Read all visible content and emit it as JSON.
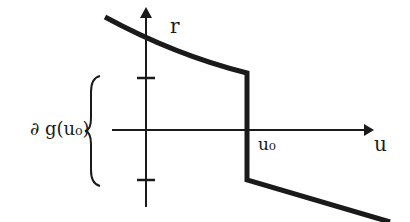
{
  "diagram": {
    "title": "",
    "axes": {
      "vertical_label": "r",
      "horizontal_label": "u"
    },
    "labels": {
      "point": "u₀",
      "subdifferential": "∂ g(u₀)"
    },
    "colors": {
      "ink": "#1a1a1a",
      "background": "#ffffff"
    },
    "graph": {
      "description": "Monotone decreasing graph with a vertical jump at u0 spanning the subdifferential interval",
      "points": [
        [
          105,
          17
        ],
        [
          146,
          40
        ],
        [
          200,
          60
        ],
        [
          247,
          73
        ],
        [
          247,
          180
        ],
        [
          320,
          200
        ],
        [
          390,
          222
        ]
      ]
    },
    "ticks": [
      {
        "y": 78,
        "meaning": "upper bound of subdifferential"
      },
      {
        "y": 180,
        "meaning": "lower bound of subdifferential"
      }
    ]
  }
}
